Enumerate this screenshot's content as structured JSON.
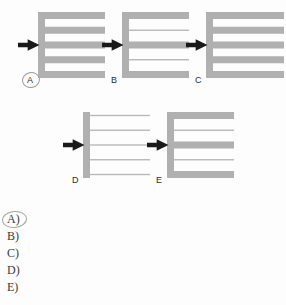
{
  "page": {
    "background_color": "#fdfdfd",
    "width": 286,
    "height": 305
  },
  "palette": {
    "bar_gray": "#b0b0b0",
    "thin_line_gray": "#b8b8b8",
    "arrow_black": "#1a1a1a",
    "label_color": "#2b2b2b",
    "option_color": "#3a3a3a",
    "circle_ink": "#9a9a9a"
  },
  "figures": [
    {
      "id": "A",
      "label": "A",
      "circled": true,
      "arrow": "right-arrow-icon",
      "spine": "thick",
      "row_count": 5,
      "rows": [
        "thick",
        "thick",
        "thick",
        "thick",
        "thick"
      ],
      "x": 17,
      "y": 10,
      "width": 90,
      "height": 80
    },
    {
      "id": "B",
      "label": "B",
      "circled": false,
      "arrow": "right-arrow-icon",
      "spine": "thick",
      "row_count": 5,
      "rows": [
        "thick",
        "thin",
        "thick",
        "thin",
        "thick"
      ],
      "x": 101,
      "y": 10,
      "width": 90,
      "height": 80
    },
    {
      "id": "C",
      "label": "C",
      "circled": false,
      "arrow": "right-arrow-icon",
      "spine": "thick",
      "row_count": 5,
      "rows": [
        "thick",
        "thick",
        "thick",
        "thick",
        "thick"
      ],
      "x": 185,
      "y": 10,
      "width": 101,
      "height": 80
    },
    {
      "id": "D",
      "label": "D",
      "circled": false,
      "arrow": "right-arrow-icon",
      "spine": "thick",
      "row_count": 5,
      "rows": [
        "thin",
        "thin",
        "thin",
        "thin",
        "thin"
      ],
      "x": 62,
      "y": 110,
      "width": 90,
      "height": 80
    },
    {
      "id": "E",
      "label": "E",
      "circled": false,
      "arrow": "right-arrow-icon",
      "spine": "thick",
      "row_count": 5,
      "rows": [
        "thick",
        "thin",
        "thick",
        "thin",
        "thick"
      ],
      "x": 146,
      "y": 110,
      "width": 90,
      "height": 80
    }
  ],
  "options": [
    {
      "label": "A)",
      "circled": true
    },
    {
      "label": "B)",
      "circled": false
    },
    {
      "label": "C)",
      "circled": false
    },
    {
      "label": "D)",
      "circled": false
    },
    {
      "label": "E)",
      "circled": false
    }
  ]
}
